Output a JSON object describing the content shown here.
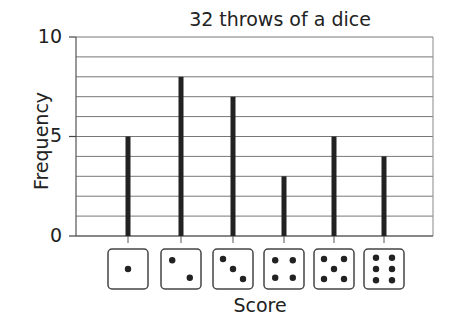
{
  "chart_data": {
    "type": "bar",
    "title": "32 throws of a dice",
    "xlabel": "Score",
    "ylabel": "Frequency",
    "categories": [
      "1",
      "2",
      "3",
      "4",
      "5",
      "6"
    ],
    "category_display": "dice faces (pips 1-6)",
    "values": [
      5,
      8,
      7,
      3,
      5,
      4
    ],
    "ylim": [
      0,
      10
    ],
    "yticks": [
      0,
      5,
      10
    ],
    "grid": true,
    "grid_step": 1,
    "legend": null
  },
  "labels": {
    "title": "32 throws of a dice",
    "xlabel": "Score",
    "ylabel": "Frequency",
    "yticks": [
      "0",
      "5",
      "10"
    ]
  }
}
